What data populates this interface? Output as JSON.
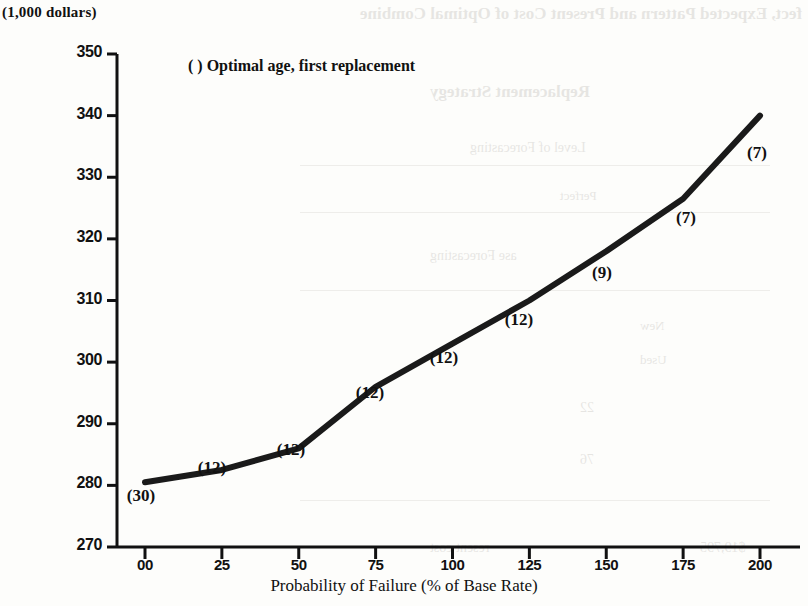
{
  "unit_label": "(1,000 dollars)",
  "legend": "( ) Optimal age, first replacement",
  "xaxis_title": "Probability of Failure (% of Base Rate)",
  "colors": {
    "ink": "#111111",
    "paper": "#fdfdfb",
    "line": "#1a1a1a"
  },
  "bleed_text": [
    "fect, Expected Pattern and Present Cost of Optimal Combine",
    "Replacement Strategy",
    "Level of Forecasting",
    "Perfect",
    "ase Forecasting",
    "New",
    "Used",
    "22",
    "76",
    "resent cost",
    "$19,795"
  ],
  "chart_data": {
    "type": "line",
    "title": "",
    "xlabel": "Probability of Failure (% of Base Rate)",
    "ylabel": "(1,000 dollars)",
    "xlim": [
      0,
      200
    ],
    "ylim": [
      270,
      350
    ],
    "grid": false,
    "legend_position": "inside-top-left",
    "legend_entries": [
      "( ) Optimal age, first replacement"
    ],
    "xticks": [
      0,
      25,
      50,
      75,
      100,
      125,
      150,
      175,
      200
    ],
    "xtick_labels": [
      "00",
      "25",
      "50",
      "75",
      "100",
      "125",
      "150",
      "175",
      "200"
    ],
    "yticks": [
      270,
      280,
      290,
      300,
      310,
      320,
      330,
      340,
      350
    ],
    "ytick_labels": [
      "270",
      "280",
      "290",
      "300",
      "310",
      "320",
      "330",
      "340",
      "350"
    ],
    "series": [
      {
        "name": "Present cost of optimal replacement strategy",
        "x": [
          0,
          25,
          50,
          75,
          100,
          125,
          150,
          175,
          200
        ],
        "values": [
          280.5,
          282.5,
          286.0,
          296.0,
          303.0,
          310.0,
          318.0,
          326.5,
          340.0
        ],
        "point_annotations": [
          "(30)",
          "(12)",
          "(12)",
          "(12)",
          "(12)",
          "(12)",
          "(9)",
          "(7)",
          "(7)"
        ],
        "annotation_meaning": "Optimal age, first replacement"
      }
    ]
  },
  "annotation_layout": [
    {
      "text": "(30)",
      "x": 141,
      "y": 498
    },
    {
      "text": "(12)",
      "x": 212,
      "y": 470
    },
    {
      "text": "(12)",
      "x": 291,
      "y": 452
    },
    {
      "text": "(12)",
      "x": 370,
      "y": 395
    },
    {
      "text": "(12)",
      "x": 444,
      "y": 360
    },
    {
      "text": "(12)",
      "x": 519,
      "y": 322
    },
    {
      "text": "(9)",
      "x": 602,
      "y": 275
    },
    {
      "text": "(7)",
      "x": 686,
      "y": 220
    },
    {
      "text": "(7)",
      "x": 757,
      "y": 155
    }
  ]
}
